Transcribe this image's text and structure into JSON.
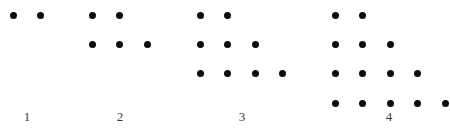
{
  "dot_color": "#0d0d0d",
  "label_color": "#3d3d3d",
  "figures": [
    {
      "label": "1",
      "rows": [
        2
      ]
    },
    {
      "label": "2",
      "rows": [
        2,
        3
      ]
    },
    {
      "label": "3",
      "rows": [
        2,
        3,
        4
      ]
    },
    {
      "label": "4",
      "rows": [
        2,
        3,
        4,
        5
      ]
    }
  ]
}
